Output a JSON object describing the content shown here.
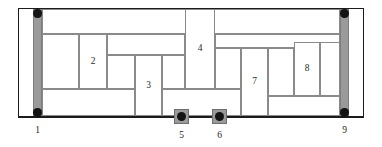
{
  "figure": {
    "kind": "structural-partition-diagram",
    "width": 382,
    "height": 147,
    "background_color": "#ffffff",
    "frame_color": "#1c1c1c",
    "partition_line_color": "#8a8a8a",
    "shaded_fill_color": "#9a9a9a",
    "node_color": "#141414"
  },
  "outer_frame": {
    "x": 18,
    "y": 8,
    "width": 346,
    "height": 110
  },
  "edge_columns": [
    {
      "name": "left-edge-column",
      "x": 33,
      "y": 9,
      "width": 9,
      "height": 108
    },
    {
      "name": "right-edge-column",
      "x": 340,
      "y": 9,
      "width": 9,
      "height": 108
    }
  ],
  "node_dots": [
    {
      "name": "node-top-left",
      "cx": 37.5,
      "cy": 13.5,
      "r": 4.2
    },
    {
      "name": "node-bottom-left",
      "cx": 37.5,
      "cy": 112.5,
      "r": 4.2
    },
    {
      "name": "node-top-right",
      "cx": 344.5,
      "cy": 13.5,
      "r": 4.2
    },
    {
      "name": "node-bottom-right",
      "cx": 344.5,
      "cy": 112.5,
      "r": 4.2
    }
  ],
  "supports": [
    {
      "name": "support-5",
      "x": 174,
      "y": 109,
      "width": 15,
      "height": 15
    },
    {
      "name": "support-6",
      "x": 212,
      "y": 109,
      "width": 15,
      "height": 15
    }
  ],
  "cells": [
    {
      "id": "cell-a",
      "x": 42,
      "y": 9,
      "width": 298,
      "height": 25,
      "label": ""
    },
    {
      "id": "cell-b",
      "x": 42,
      "y": 34,
      "width": 37,
      "height": 55,
      "label": ""
    },
    {
      "id": "cell-2",
      "x": 79,
      "y": 34,
      "width": 28,
      "height": 55,
      "label": "2"
    },
    {
      "id": "cell-c",
      "x": 107,
      "y": 34,
      "width": 78,
      "height": 21,
      "label": ""
    },
    {
      "id": "cell-d",
      "x": 107,
      "y": 55,
      "width": 28,
      "height": 34,
      "label": ""
    },
    {
      "id": "cell-3",
      "x": 135,
      "y": 55,
      "width": 27,
      "height": 61,
      "label": "3"
    },
    {
      "id": "cell-e",
      "x": 162,
      "y": 55,
      "width": 23,
      "height": 34,
      "label": ""
    },
    {
      "id": "cell-4",
      "x": 185,
      "y": 9,
      "width": 30,
      "height": 80,
      "label": "4"
    },
    {
      "id": "cell-f",
      "x": 215,
      "y": 34,
      "width": 125,
      "height": 14,
      "label": ""
    },
    {
      "id": "cell-g",
      "x": 215,
      "y": 48,
      "width": 26,
      "height": 41,
      "label": ""
    },
    {
      "id": "cell-7",
      "x": 241,
      "y": 48,
      "width": 27,
      "height": 68,
      "label": "7"
    },
    {
      "id": "cell-h",
      "x": 268,
      "y": 48,
      "width": 26,
      "height": 48,
      "label": ""
    },
    {
      "id": "cell-8",
      "x": 294,
      "y": 42,
      "width": 26,
      "height": 54,
      "label": "8"
    },
    {
      "id": "cell-i",
      "x": 320,
      "y": 42,
      "width": 20,
      "height": 54,
      "label": ""
    },
    {
      "id": "cell-j",
      "x": 268,
      "y": 96,
      "width": 72,
      "height": 20,
      "label": ""
    },
    {
      "id": "cell-k",
      "x": 42,
      "y": 89,
      "width": 93,
      "height": 27,
      "label": ""
    },
    {
      "id": "cell-l",
      "x": 162,
      "y": 89,
      "width": 79,
      "height": 27,
      "label": ""
    }
  ],
  "callouts": [
    {
      "id": "callout-1",
      "label": "1",
      "x": 37.5,
      "y": 126
    },
    {
      "id": "callout-5",
      "label": "5",
      "x": 181.5,
      "y": 131
    },
    {
      "id": "callout-6",
      "label": "6",
      "x": 219.5,
      "y": 131
    },
    {
      "id": "callout-9",
      "label": "9",
      "x": 344.5,
      "y": 126
    }
  ],
  "base_line": {
    "x": 18,
    "y": 116,
    "width": 346,
    "height": 1.4
  }
}
